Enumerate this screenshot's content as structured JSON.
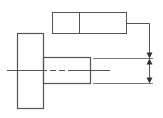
{
  "diagram": {
    "type": "engineering-drawing",
    "colors": {
      "line": "#555555",
      "background": "#ffffff"
    },
    "feature_control_frame": {
      "cells": [
        "",
        ""
      ]
    }
  }
}
